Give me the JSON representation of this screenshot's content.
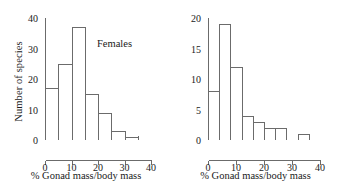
{
  "figure": {
    "background": "#ffffff",
    "line_color": "#6b6b6b",
    "bar_fill": "#ffffff"
  },
  "chart_data": [
    {
      "type": "bar",
      "title": "",
      "annotation": "Females",
      "xlabel": "% Gonad mass/body mass",
      "ylabel": "Number of species",
      "xlim": [
        0,
        40
      ],
      "ylim": [
        0,
        40
      ],
      "xticks": [
        0,
        10,
        20,
        30,
        40
      ],
      "xtick_labels": [
        "0",
        "10",
        "20",
        "30",
        "40"
      ],
      "xminor_step": 5,
      "yticks": [
        0,
        10,
        20,
        30,
        40
      ],
      "ytick_labels": [
        "0",
        "10",
        "20",
        "30",
        "40"
      ],
      "grid": false,
      "legend": "none",
      "bin_width": 5,
      "bin_edges": [
        0,
        5,
        10,
        15,
        20,
        25,
        30,
        35
      ],
      "categories": [
        "0-5",
        "5-10",
        "10-15",
        "15-20",
        "20-25",
        "25-30",
        "30-35"
      ],
      "values": [
        17,
        25,
        37,
        15,
        9,
        3,
        1
      ]
    },
    {
      "type": "bar",
      "title": "",
      "annotation": "Males",
      "xlabel": "% Gonad mass/body mass",
      "ylabel": "",
      "xlim": [
        0,
        40
      ],
      "ylim": [
        0,
        20
      ],
      "xticks": [
        0,
        10,
        20,
        30,
        40
      ],
      "xtick_labels": [
        "0",
        "10",
        "20",
        "30",
        "40"
      ],
      "xminor_step": 4,
      "yticks": [
        0,
        5,
        10,
        15,
        20
      ],
      "ytick_labels": [
        "0",
        "5",
        "10",
        "15",
        "20"
      ],
      "grid": false,
      "legend": "none",
      "bin_width": 4,
      "bin_edges": [
        0,
        4,
        8,
        12,
        16,
        20,
        24,
        28,
        32,
        36
      ],
      "categories": [
        "0-4",
        "4-8",
        "8-12",
        "12-16",
        "16-20",
        "20-24",
        "24-28",
        "28-32",
        "32-36"
      ],
      "values": [
        8,
        19,
        12,
        4,
        3,
        2,
        2,
        0,
        1
      ]
    }
  ]
}
